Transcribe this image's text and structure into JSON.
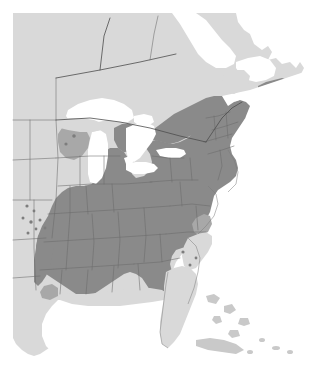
{
  "figure": {
    "kind": "species-distribution-map",
    "title": "",
    "caption": "",
    "region_name": "Eastern North America",
    "width_px": 320,
    "height_px": 379,
    "background_color": "#ffffff"
  },
  "legend": {
    "visible": false,
    "entries": [
      {
        "label": "Range (shaded)",
        "color": "#8a8a8a"
      },
      {
        "label": "Land outside range",
        "color": "#d9d9d9"
      },
      {
        "label": "Water",
        "color": "#ffffff"
      }
    ]
  },
  "colors": {
    "range_fill": "#8a8a8a",
    "partial_fill": "#a8a8a8",
    "land_fill": "#d9d9d9",
    "water_fill": "#ffffff",
    "admin_border": "#6a6a6a",
    "country_border": "#4d4d4d",
    "isolate_dot": "#7d7d7d"
  },
  "map_features": {
    "water_bodies": [
      {
        "name": "Atlantic Ocean"
      },
      {
        "name": "Gulf of Mexico"
      },
      {
        "name": "Hudson Bay approach"
      },
      {
        "name": "Lake Superior"
      },
      {
        "name": "Lake Michigan"
      },
      {
        "name": "Lake Huron"
      },
      {
        "name": "Lake Erie"
      },
      {
        "name": "Lake Ontario"
      },
      {
        "name": "Gulf of St. Lawrence"
      }
    ],
    "shaded_regions": [
      {
        "name": "New England"
      },
      {
        "name": "Mid-Atlantic"
      },
      {
        "name": "Appalachians"
      },
      {
        "name": "Great Lakes states"
      },
      {
        "name": "Southeast interior"
      },
      {
        "name": "Lower Mississippi Valley"
      },
      {
        "name": "East Texas"
      },
      {
        "name": "Southern Ontario and Quebec"
      },
      {
        "name": "New Brunswick and Nova Scotia"
      }
    ],
    "unshaded_regions": [
      {
        "name": "Central Canada"
      },
      {
        "name": "Northern Ontario and Quebec"
      },
      {
        "name": "Great Plains"
      },
      {
        "name": "Florida peninsula"
      },
      {
        "name": "Atlantic coastal plain"
      },
      {
        "name": "Gulf coastal strip"
      },
      {
        "name": "Upper Michigan and Northern Wisconsin"
      },
      {
        "name": "Northern Maine"
      },
      {
        "name": "Bahamas"
      },
      {
        "name": "Cuba"
      }
    ],
    "isolated_populations": [
      {
        "x": 27,
        "y": 206
      },
      {
        "x": 34,
        "y": 211
      },
      {
        "x": 23,
        "y": 218
      },
      {
        "x": 31,
        "y": 222
      },
      {
        "x": 40,
        "y": 220
      },
      {
        "x": 36,
        "y": 229
      },
      {
        "x": 28,
        "y": 233
      },
      {
        "x": 45,
        "y": 228
      },
      {
        "x": 183,
        "y": 252
      },
      {
        "x": 190,
        "y": 265
      },
      {
        "x": 196,
        "y": 258
      },
      {
        "x": 74,
        "y": 136
      },
      {
        "x": 66,
        "y": 144
      }
    ]
  }
}
